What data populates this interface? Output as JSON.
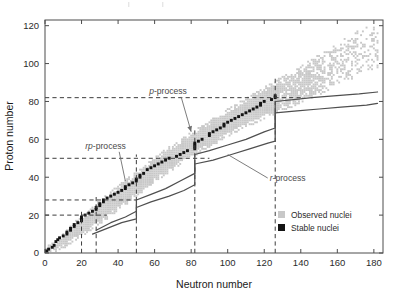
{
  "figure": {
    "background": "#ffffff",
    "plot_frame_color": "#4c4c4c"
  },
  "chart_data": {
    "type": "scatter",
    "title": "",
    "xlabel": "Neutron number",
    "ylabel": "Proton number",
    "xlim": [
      0,
      185
    ],
    "ylim": [
      0,
      123
    ],
    "xticks": [
      0,
      20,
      40,
      60,
      80,
      100,
      120,
      140,
      160,
      180
    ],
    "yticks": [
      0,
      20,
      40,
      60,
      80,
      100,
      120
    ],
    "grid": false,
    "legend_position": "bottom-right",
    "series": [
      {
        "name": "Observed nuclei",
        "color": "#c8c8c8",
        "marker": "square",
        "description": "Broad band of experimentally observed isotopes spanning from the proton drip line to the neutron drip line",
        "band": {
          "comment": "Band expressed as (N, Z_lower, Z_upper) envelope vertices tracing the observed nuclide chart",
          "lower_edge": [
            [
              0,
              0
            ],
            [
              8,
              2
            ],
            [
              18,
              8
            ],
            [
              30,
              16
            ],
            [
              44,
              26
            ],
            [
              60,
              38
            ],
            [
              78,
              50
            ],
            [
              96,
              60
            ],
            [
              112,
              68
            ],
            [
              126,
              74
            ],
            [
              140,
              80
            ],
            [
              154,
              86
            ],
            [
              168,
              92
            ],
            [
              180,
              98
            ]
          ],
          "upper_edge": [
            [
              0,
              2
            ],
            [
              6,
              6
            ],
            [
              14,
              14
            ],
            [
              24,
              22
            ],
            [
              36,
              32
            ],
            [
              50,
              42
            ],
            [
              66,
              54
            ],
            [
              82,
              64
            ],
            [
              98,
              74
            ],
            [
              112,
              82
            ],
            [
              126,
              90
            ],
            [
              140,
              98
            ],
            [
              154,
              106
            ],
            [
              166,
              114
            ],
            [
              176,
              120
            ]
          ]
        }
      },
      {
        "name": "Stable nuclei",
        "color": "#141414",
        "marker": "square",
        "description": "Narrow valley of beta stability running through the centre of the observed band, ending near Z=83",
        "points": [
          [
            0,
            1
          ],
          [
            1,
            1
          ],
          [
            2,
            2
          ],
          [
            4,
            3
          ],
          [
            5,
            4
          ],
          [
            6,
            6
          ],
          [
            7,
            7
          ],
          [
            8,
            8
          ],
          [
            10,
            9
          ],
          [
            12,
            10
          ],
          [
            12,
            11
          ],
          [
            14,
            12
          ],
          [
            14,
            13
          ],
          [
            16,
            14
          ],
          [
            16,
            15
          ],
          [
            18,
            16
          ],
          [
            20,
            17
          ],
          [
            20,
            18
          ],
          [
            20,
            19
          ],
          [
            22,
            20
          ],
          [
            24,
            21
          ],
          [
            26,
            22
          ],
          [
            28,
            23
          ],
          [
            28,
            24
          ],
          [
            30,
            25
          ],
          [
            30,
            26
          ],
          [
            32,
            27
          ],
          [
            32,
            28
          ],
          [
            34,
            29
          ],
          [
            36,
            30
          ],
          [
            38,
            31
          ],
          [
            40,
            32
          ],
          [
            42,
            33
          ],
          [
            44,
            34
          ],
          [
            44,
            35
          ],
          [
            46,
            36
          ],
          [
            48,
            37
          ],
          [
            50,
            38
          ],
          [
            50,
            39
          ],
          [
            52,
            40
          ],
          [
            52,
            41
          ],
          [
            54,
            42
          ],
          [
            56,
            44
          ],
          [
            58,
            45
          ],
          [
            60,
            46
          ],
          [
            62,
            47
          ],
          [
            64,
            48
          ],
          [
            66,
            49
          ],
          [
            68,
            50
          ],
          [
            72,
            51
          ],
          [
            74,
            52
          ],
          [
            76,
            53
          ],
          [
            78,
            54
          ],
          [
            82,
            55
          ],
          [
            82,
            56
          ],
          [
            82,
            57
          ],
          [
            82,
            58
          ],
          [
            84,
            59
          ],
          [
            86,
            60
          ],
          [
            90,
            62
          ],
          [
            90,
            63
          ],
          [
            92,
            64
          ],
          [
            94,
            65
          ],
          [
            96,
            66
          ],
          [
            98,
            67
          ],
          [
            98,
            68
          ],
          [
            100,
            69
          ],
          [
            102,
            70
          ],
          [
            104,
            71
          ],
          [
            106,
            72
          ],
          [
            108,
            73
          ],
          [
            110,
            74
          ],
          [
            112,
            75
          ],
          [
            114,
            76
          ],
          [
            116,
            77
          ],
          [
            118,
            78
          ],
          [
            118,
            79
          ],
          [
            120,
            80
          ],
          [
            124,
            81
          ],
          [
            126,
            82
          ],
          [
            126,
            83
          ]
        ]
      }
    ],
    "annotations": [
      {
        "label": "rp-process",
        "italic_prefix": "rp",
        "text_xy": [
          22,
          55
        ],
        "target_xy": [
          44,
          38
        ],
        "description": "Rapid proton capture path along the proton-rich side of stability"
      },
      {
        "label": "p-process",
        "italic_prefix": "p",
        "text_xy": [
          57,
          84
        ],
        "target_xy": [
          80,
          64
        ],
        "description": "Photodisintegration process producing proton-rich stable isotopes"
      },
      {
        "label": "r-process",
        "italic_prefix": "r",
        "text_xy": [
          123,
          38
        ],
        "target_xy": [
          100,
          52
        ],
        "description": "Rapid neutron capture path on the neutron-rich side"
      }
    ],
    "magic_numbers": {
      "description": "Dashed lines marking nuclear shell closures",
      "proton_magic_z": [
        20,
        28,
        50,
        82
      ],
      "neutron_magic_n": [
        20,
        28,
        50,
        82,
        126
      ]
    },
    "r_process_path": {
      "description": "Two solid curves bounding the r-process reaction flow on the neutron-rich side, with vertical jumps at the N=82 and N=126 shell closures",
      "color": "#4f4f4f",
      "upper_curve": [
        [
          28,
          12
        ],
        [
          36,
          16
        ],
        [
          44,
          19
        ],
        [
          50,
          22
        ],
        [
          50,
          28
        ],
        [
          58,
          31
        ],
        [
          66,
          34
        ],
        [
          74,
          38
        ],
        [
          82,
          42
        ],
        [
          82,
          52
        ],
        [
          90,
          54
        ],
        [
          100,
          57
        ],
        [
          110,
          60
        ],
        [
          120,
          64
        ],
        [
          126,
          66
        ],
        [
          126,
          80
        ],
        [
          136,
          81
        ],
        [
          146,
          82
        ],
        [
          158,
          83
        ],
        [
          172,
          84
        ],
        [
          182,
          85
        ]
      ],
      "lower_curve": [
        [
          26,
          10
        ],
        [
          34,
          13
        ],
        [
          42,
          16
        ],
        [
          50,
          18
        ],
        [
          50,
          24
        ],
        [
          58,
          27
        ],
        [
          68,
          30
        ],
        [
          76,
          33
        ],
        [
          82,
          36
        ],
        [
          82,
          47
        ],
        [
          92,
          49
        ],
        [
          102,
          52
        ],
        [
          112,
          55
        ],
        [
          122,
          58
        ],
        [
          126,
          59
        ],
        [
          126,
          74
        ],
        [
          138,
          75
        ],
        [
          150,
          76
        ],
        [
          162,
          77
        ],
        [
          176,
          78
        ],
        [
          182,
          79
        ]
      ]
    }
  },
  "legend": {
    "items": [
      {
        "label": "Observed nuclei",
        "color": "#c8c8c8",
        "swatch": "square"
      },
      {
        "label": "Stable nuclei",
        "color": "#141414",
        "swatch": "square"
      }
    ]
  },
  "axes": {
    "x_title": "Neutron number",
    "y_title": "Proton number",
    "x_tick_labels": [
      "0",
      "20",
      "40",
      "60",
      "80",
      "100",
      "120",
      "140",
      "160",
      "180"
    ],
    "y_tick_labels": [
      "0",
      "20",
      "40",
      "60",
      "80",
      "100",
      "120"
    ]
  }
}
